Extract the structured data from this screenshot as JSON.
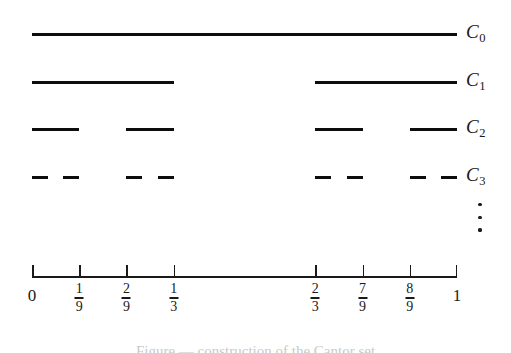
{
  "figure": {
    "axis_start_px": 32,
    "axis_end_px": 457,
    "line_color": "#0d0d0d",
    "background": "#ffffff"
  },
  "chart_data": {
    "type": "diagram",
    "xlabel": "",
    "ylabel": "",
    "xlim": [
      0,
      1
    ],
    "grid": false,
    "legend": "right",
    "stages": [
      {
        "label": "C",
        "subscript": "0",
        "y_px": 33,
        "count": 1,
        "segments": [
          [
            0,
            1
          ]
        ]
      },
      {
        "label": "C",
        "subscript": "1",
        "y_px": 81,
        "count": 2,
        "segments": [
          [
            0,
            0.333333
          ],
          [
            0.666667,
            1
          ]
        ]
      },
      {
        "label": "C",
        "subscript": "2",
        "y_px": 128,
        "count": 4,
        "segments": [
          [
            0,
            0.111111
          ],
          [
            0.222222,
            0.333333
          ],
          [
            0.666667,
            0.777778
          ],
          [
            0.888889,
            1
          ]
        ]
      },
      {
        "label": "C",
        "subscript": "3",
        "y_px": 176,
        "count": 8,
        "segments": [
          [
            0,
            0.037037
          ],
          [
            0.074074,
            0.111111
          ],
          [
            0.222222,
            0.259259
          ],
          [
            0.296296,
            0.333333
          ],
          [
            0.666667,
            0.703704
          ],
          [
            0.740741,
            0.777778
          ],
          [
            0.888889,
            0.925926
          ],
          [
            0.962963,
            1
          ]
        ]
      }
    ],
    "continuation_marker": "⋮",
    "axis": {
      "ticks": [
        {
          "value": 0,
          "kind": "endcap",
          "display": "integer",
          "text": "0"
        },
        {
          "value": 0.111111,
          "kind": "inner",
          "display": "fraction",
          "num": "1",
          "den": "9"
        },
        {
          "value": 0.222222,
          "kind": "inner",
          "display": "fraction",
          "num": "2",
          "den": "9"
        },
        {
          "value": 0.333333,
          "kind": "inner",
          "display": "fraction",
          "num": "1",
          "den": "3"
        },
        {
          "value": 0.666667,
          "kind": "inner",
          "display": "fraction",
          "num": "2",
          "den": "3"
        },
        {
          "value": 0.777778,
          "kind": "inner",
          "display": "fraction",
          "num": "7",
          "den": "9"
        },
        {
          "value": 0.888889,
          "kind": "inner",
          "display": "fraction",
          "num": "8",
          "den": "9"
        },
        {
          "value": 1,
          "kind": "endcap",
          "display": "integer",
          "text": "1"
        }
      ]
    }
  },
  "caption": {
    "text": "Figure — construction of the Cantor set"
  }
}
